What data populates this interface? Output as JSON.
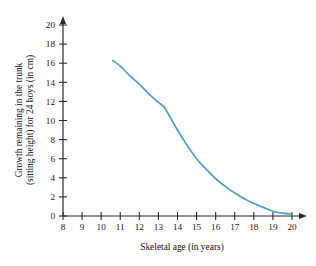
{
  "chart_data": {
    "type": "line",
    "title": "",
    "xlabel": "Skeletal age (in years)",
    "ylabel": "Growth remaining in the trunk (sitting height) for 24 boys (in cm)",
    "ylabel_line1": "Growth remaining in the trunk",
    "ylabel_line2": "(sitting height) for 24 boys (in cm)",
    "xlim": [
      8,
      20
    ],
    "ylim": [
      0,
      20
    ],
    "grid": false,
    "legend": "none",
    "xticks": [
      8,
      9,
      10,
      11,
      12,
      13,
      14,
      15,
      16,
      17,
      18,
      19,
      20
    ],
    "yticks": [
      0,
      2,
      4,
      6,
      8,
      10,
      12,
      14,
      16,
      18,
      20
    ],
    "xtick_labels": [
      "8",
      "9",
      "10",
      "11",
      "12",
      "13",
      "14",
      "15",
      "16",
      "17",
      "18",
      "19",
      "20"
    ],
    "ytick_labels": [
      "0",
      "2",
      "4",
      "6",
      "8",
      "10",
      "12",
      "14",
      "16",
      "18",
      "20"
    ],
    "series": [
      {
        "name": "Growth remaining in trunk",
        "color": "#539FC7",
        "x": [
          10.6,
          11.0,
          11.5,
          12.0,
          12.5,
          13.0,
          13.3,
          13.6,
          14.0,
          14.5,
          15.0,
          15.5,
          16.0,
          16.5,
          17.0,
          17.5,
          18.0,
          18.5,
          19.0,
          19.5,
          20.0
        ],
        "y": [
          16.3,
          15.7,
          14.7,
          13.8,
          12.8,
          11.9,
          11.4,
          10.4,
          9.0,
          7.4,
          6.0,
          4.9,
          3.9,
          3.1,
          2.4,
          1.8,
          1.3,
          0.9,
          0.5,
          0.3,
          0.2
        ]
      }
    ]
  },
  "axes": {
    "x_axis_name": "skeletal-age-axis",
    "y_axis_name": "growth-remaining-axis"
  },
  "colors": {
    "curve": "#539FC7",
    "axis": "#2b2b2b",
    "background": "#ffffff",
    "text": "#1a1a1a"
  }
}
